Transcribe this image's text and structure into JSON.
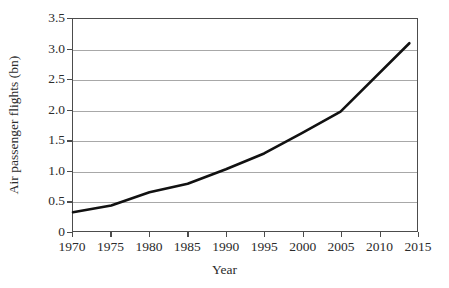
{
  "chart_data": {
    "type": "line",
    "title": "",
    "xlabel": "Year",
    "ylabel": "Air passenger flights (bn)",
    "xlim": [
      1970,
      2015
    ],
    "ylim": [
      0,
      3.5
    ],
    "grid": true,
    "legend": "none",
    "xticks": [
      "1970",
      "1975",
      "1980",
      "1985",
      "1990",
      "1995",
      "2000",
      "2005",
      "2010",
      "2015"
    ],
    "xtick_values": [
      1970,
      1975,
      1980,
      1985,
      1990,
      1995,
      2000,
      2005,
      2010,
      2015
    ],
    "yticks": [
      "0",
      "0.5",
      "1.0",
      "1.5",
      "2.0",
      "2.5",
      "3.0",
      "3.5"
    ],
    "ytick_values": [
      0,
      0.5,
      1.0,
      1.5,
      2.0,
      2.5,
      3.0,
      3.5
    ],
    "series": [
      {
        "name": "Air passenger flights",
        "color": "#111111",
        "line_width": 2.6,
        "x": [
          1970,
          1975,
          1980,
          1985,
          1990,
          1995,
          2000,
          2005,
          2014
        ],
        "values": [
          0.31,
          0.42,
          0.64,
          0.78,
          1.02,
          1.28,
          1.62,
          1.97,
          3.1
        ]
      }
    ]
  },
  "axes": {
    "frame_color": "#4c4c4c",
    "grid_color": "#a8a8a8"
  }
}
